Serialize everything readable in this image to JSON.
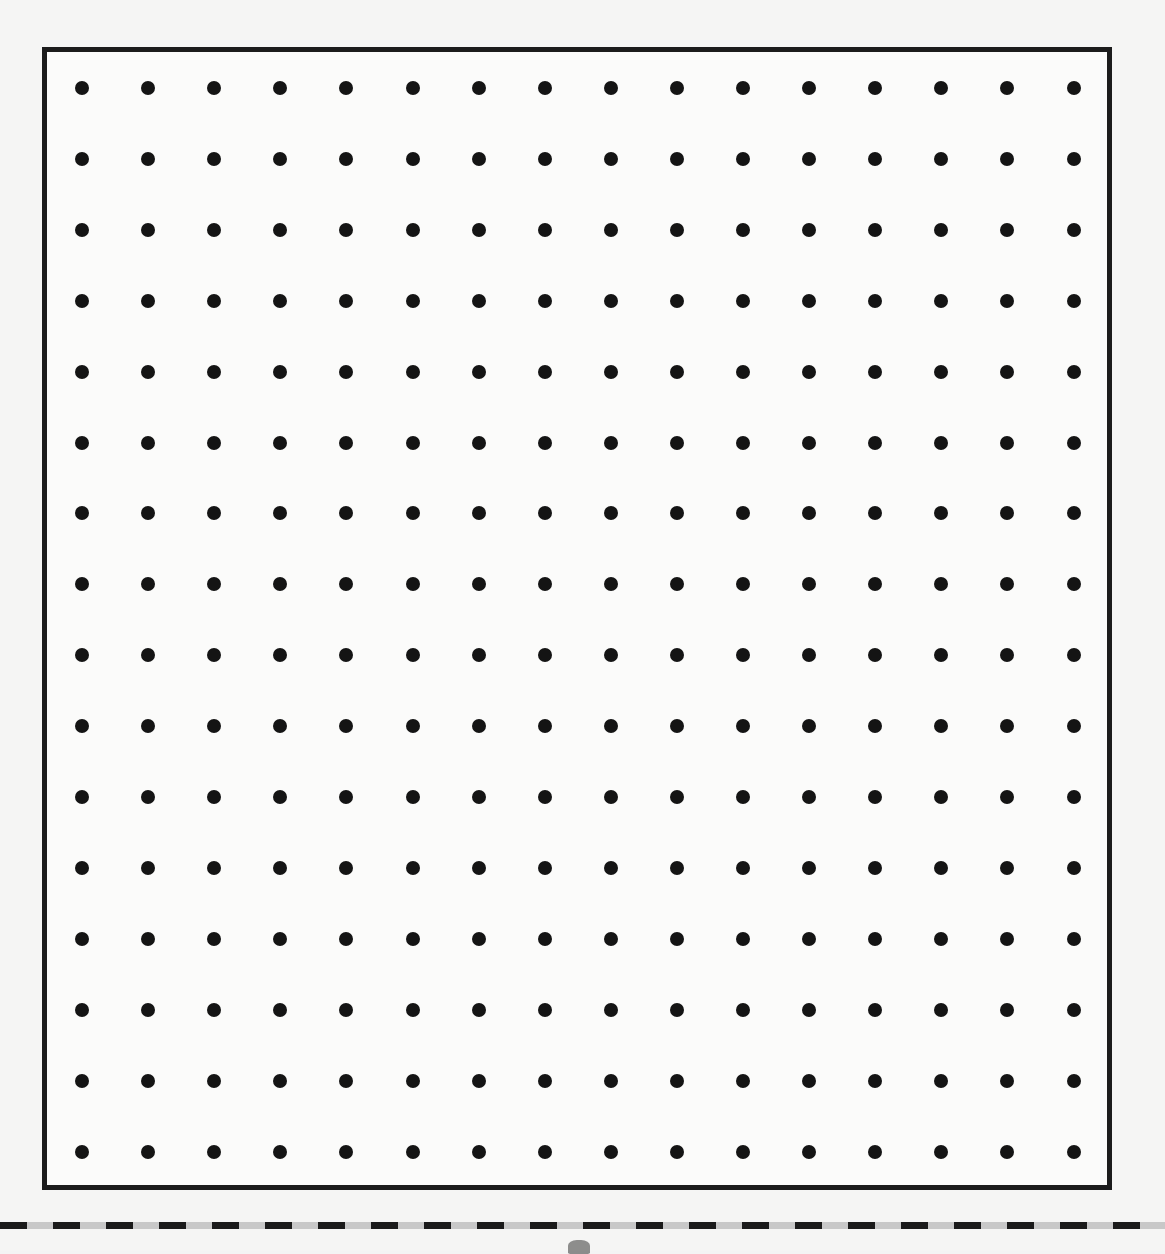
{
  "worksheet": {
    "type": "dot-grid",
    "columns": 16,
    "rows": 16,
    "dot_color": "#141414",
    "border_color": "#1c1c1c",
    "paper_color": "#fbfbfa"
  },
  "grid_geometry": {
    "first_dot_x": 82,
    "first_dot_y": 88,
    "spacing_x": 66.1,
    "spacing_y": 70.9
  },
  "cut_line": {
    "style": "dashed",
    "dash_color": "#1a1a1a",
    "gap_color": "#c8c8c8"
  }
}
